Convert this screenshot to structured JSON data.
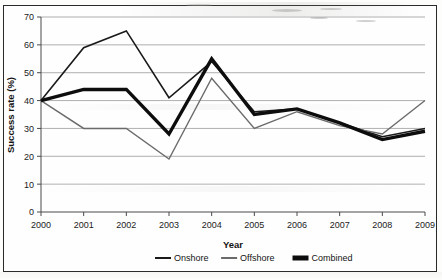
{
  "figure": {
    "background_color": "#fefefe",
    "frame_color": "#2a2a2a"
  },
  "chart_data": {
    "type": "line",
    "title": "",
    "xlabel": "Year",
    "ylabel": "Success rate (%)",
    "categories": [
      "2000",
      "2001",
      "2002",
      "2003",
      "2004",
      "2005",
      "2006",
      "2007",
      "2008",
      "2009"
    ],
    "x": [
      2000,
      2001,
      2002,
      2003,
      2004,
      2005,
      2006,
      2007,
      2008,
      2009
    ],
    "xlim": [
      2000,
      2009
    ],
    "ylim": [
      0,
      70
    ],
    "yticks": [
      0,
      10,
      20,
      30,
      40,
      50,
      60,
      70
    ],
    "xticks": [
      2000,
      2001,
      2002,
      2003,
      2004,
      2005,
      2006,
      2007,
      2008,
      2009
    ],
    "grid": true,
    "grid_axis": "y",
    "legend_position": "bottom",
    "series": [
      {
        "name": "Onshore",
        "values": [
          40,
          59,
          65,
          41,
          54,
          36,
          37,
          32,
          27,
          30
        ],
        "color": "#1a1a1a",
        "line_width": 1.6
      },
      {
        "name": "Offshore",
        "values": [
          40,
          30,
          30,
          19,
          48,
          30,
          36,
          31,
          28,
          40
        ],
        "color": "#6b6b6b",
        "line_width": 1.4
      },
      {
        "name": "Combined",
        "values": [
          40,
          44,
          44,
          28,
          55,
          35,
          37,
          32,
          26,
          29
        ],
        "color": "#0d0d0d",
        "line_width": 3.4
      }
    ]
  },
  "legend": {
    "items": [
      {
        "label": "Onshore",
        "swatch": "thin-dark-line"
      },
      {
        "label": "Offshore",
        "swatch": "thin-gray-line"
      },
      {
        "label": "Combined",
        "swatch": "thick-dark-line"
      }
    ]
  },
  "axes": {
    "y_tick_labels": [
      "70",
      "60",
      "50",
      "40",
      "30",
      "20",
      "10",
      "0"
    ],
    "x_tick_labels": [
      "2000",
      "2001",
      "2002",
      "2003",
      "2004",
      "2005",
      "2006",
      "2007",
      "2008",
      "2009"
    ]
  }
}
